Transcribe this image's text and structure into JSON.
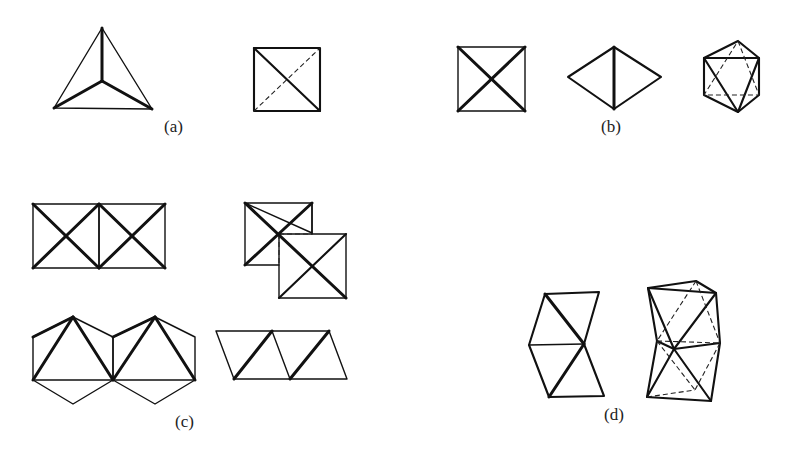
{
  "figure": {
    "panels": [
      {
        "id": "a",
        "label": "(a)",
        "description": "Tetrahedron viewed along a 3-fold axis and along a 2-fold axis"
      },
      {
        "id": "b",
        "label": "(b)",
        "description": "Octahedron viewed along 4-fold, 2-fold and 3-fold axes"
      },
      {
        "id": "c",
        "label": "(c)",
        "description": "Pairs of octahedra sharing edges and faces, in several projections"
      },
      {
        "id": "d",
        "label": "(d)",
        "description": "Pairs of octahedra sharing a face"
      }
    ]
  }
}
